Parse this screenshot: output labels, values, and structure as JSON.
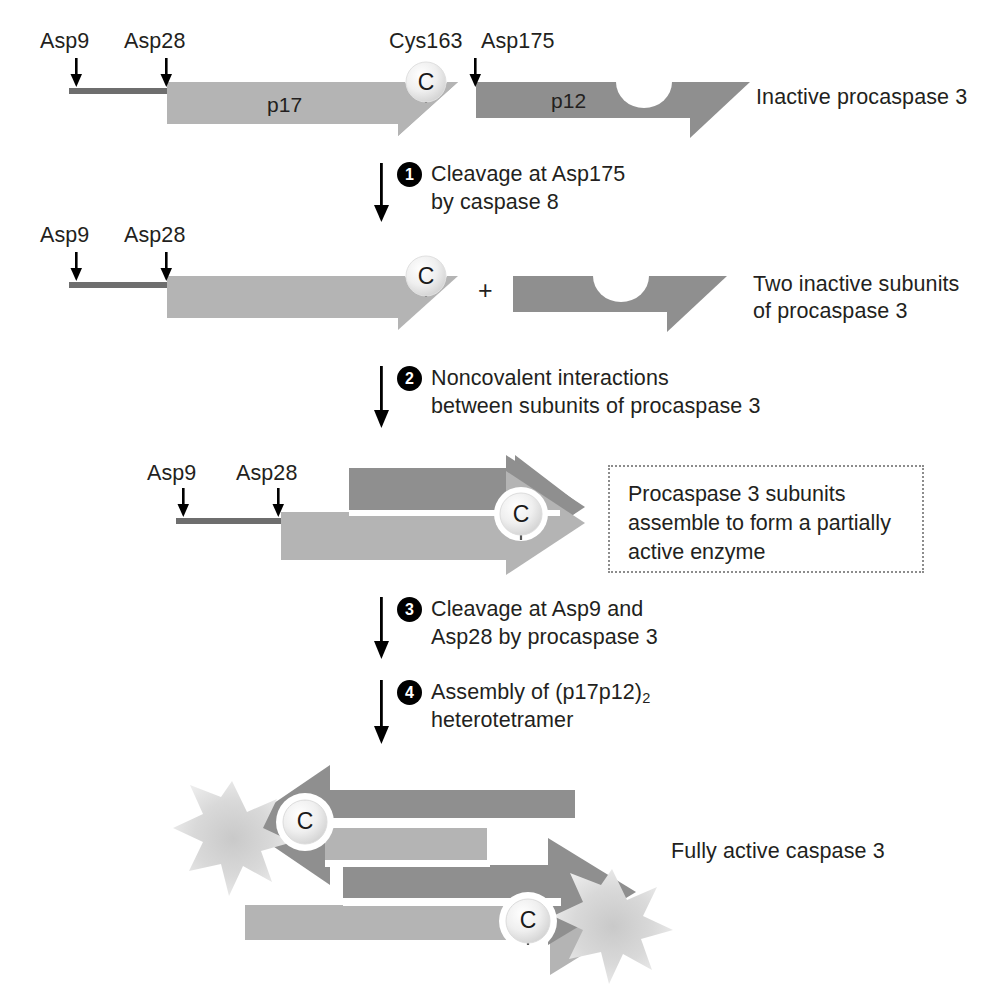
{
  "figure": {
    "colors": {
      "p17_light_gray": "#b4b4b4",
      "p12_dark_gray": "#8f8f8f",
      "prodomain_line": "#6e6e6e",
      "cys_circle": "#e8e8e8",
      "starburst": "#d8d8d8",
      "text": "#231f20",
      "step_badge": "#000000",
      "callout_border": "#8c8c8c"
    }
  },
  "rows": {
    "row1": {
      "site_labels": [
        "Asp9",
        "Asp28",
        "Cys163",
        "Asp175"
      ],
      "subunit_labels": [
        "p17",
        "p12"
      ],
      "cys_letter": "C",
      "caption": "Inactive procaspase 3"
    },
    "row2": {
      "site_labels": [
        "Asp9",
        "Asp28"
      ],
      "cys_letter": "C",
      "plus_sign": "+",
      "caption_line1": "Two inactive subunits",
      "caption_line2": "of procaspase 3"
    },
    "row3": {
      "site_labels": [
        "Asp9",
        "Asp28"
      ],
      "cys_letter": "C",
      "callout_line1": "Procaspase 3 subunits",
      "callout_line2": "assemble to form a partially",
      "callout_line3": "active enzyme"
    },
    "row4": {
      "cys_letter_left": "C",
      "cys_letter_right": "C",
      "caption": "Fully active caspase 3"
    }
  },
  "steps": [
    {
      "number": "1",
      "line1": "Cleavage at Asp175",
      "line2": "by caspase 8"
    },
    {
      "number": "2",
      "line1": "Noncovalent interactions",
      "line2": "between subunits of procaspase 3"
    },
    {
      "number": "3",
      "line1": "Cleavage at Asp9 and",
      "line2": "Asp28 by procaspase 3"
    },
    {
      "number": "4",
      "line1_pre": "Assembly of (p17p12)",
      "line1_sub": "2",
      "line2": "heterotetramer"
    }
  ]
}
